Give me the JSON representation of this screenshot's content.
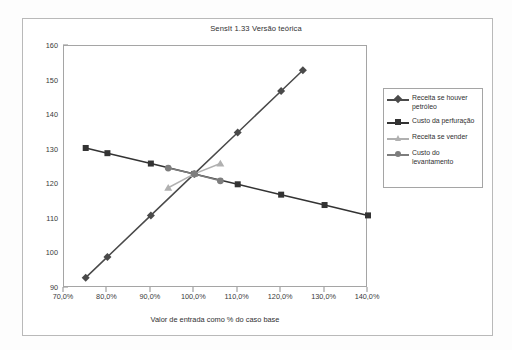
{
  "chart_data": {
    "type": "line",
    "title": "SensIt 1.33 Versão teórica",
    "xlabel": "Valor de entrada como % do caso base",
    "ylabel": "",
    "xlim": [
      70,
      140
    ],
    "ylim": [
      90,
      160
    ],
    "grid": false,
    "legend_position": "right",
    "x_tick_labels": [
      "70,0%",
      "80,0%",
      "90,0%",
      "100,0%",
      "110,0%",
      "120,0%",
      "130,0%",
      "140,0%"
    ],
    "x_tick_values": [
      70,
      80,
      90,
      100,
      110,
      120,
      130,
      140
    ],
    "y_tick_labels": [
      "90",
      "100",
      "110",
      "120",
      "130",
      "140",
      "150",
      "160"
    ],
    "y_tick_values": [
      90,
      100,
      110,
      120,
      130,
      140,
      150,
      160
    ],
    "series": [
      {
        "name": "Receita se houver petróleo",
        "marker": "diamond",
        "color": "#4a4a4a",
        "x": [
          75,
          80,
          90,
          100,
          110,
          120,
          125
        ],
        "values": [
          93,
          99,
          111,
          123,
          135,
          147,
          153
        ]
      },
      {
        "name": "Custo da perfuração",
        "marker": "square",
        "color": "#333333",
        "x": [
          75,
          80,
          90,
          100,
          110,
          120,
          130,
          140
        ],
        "values": [
          130.5,
          129,
          126,
          123,
          120,
          117,
          114,
          111
        ]
      },
      {
        "name": "Receita se vender",
        "marker": "triangle",
        "color": "#b0b0b0",
        "x": [
          94,
          100,
          106
        ],
        "values": [
          119,
          123,
          126
        ]
      },
      {
        "name": "Custo do levantamento",
        "marker": "circle",
        "color": "#7d7d7d",
        "x": [
          94,
          100,
          106
        ],
        "values": [
          124.7,
          123,
          121
        ]
      }
    ]
  },
  "legend": {
    "items": [
      {
        "label": "Receita se houver petróleo"
      },
      {
        "label": "Custo da perfuração"
      },
      {
        "label": "Receita se vender"
      },
      {
        "label": "Custo do levantamento"
      }
    ]
  }
}
